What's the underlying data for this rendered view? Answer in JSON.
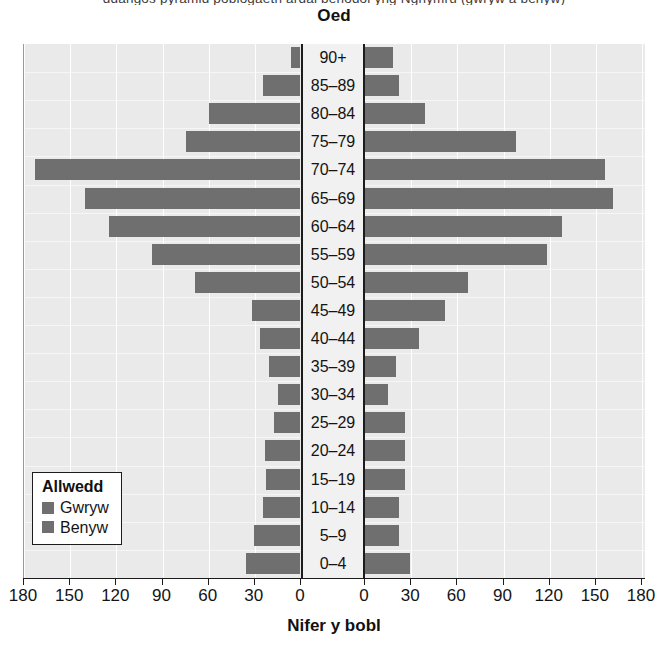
{
  "page": {
    "clipped_top_text": "ddangos pyramid poblogaeth ardal benodol yng Nghymru (gwryw a benyw)"
  },
  "chart": {
    "title": "Oed",
    "xaxis_title": "Nifer y bobl",
    "legend": {
      "title": "Allwedd",
      "items": [
        {
          "label": "Gwryw",
          "color": "#6f6f6f"
        },
        {
          "label": "Benyw",
          "color": "#6f6f6f"
        }
      ]
    },
    "tick_labels_left": [
      "180",
      "150",
      "120",
      "90",
      "60",
      "30",
      "0"
    ],
    "tick_labels_right": [
      "0",
      "30",
      "60",
      "90",
      "120",
      "150",
      "180"
    ]
  },
  "chart_data": {
    "type": "bar",
    "subtype": "population-pyramid",
    "title": "Oed",
    "xlabel": "Nifer y bobl",
    "ylabel": "Oed",
    "xlim": [
      0,
      180
    ],
    "xticks": [
      0,
      30,
      60,
      90,
      120,
      150,
      180
    ],
    "grid": true,
    "legend_position": "bottom-left",
    "categories": [
      "90+",
      "85–89",
      "80–84",
      "75–79",
      "70–74",
      "65–69",
      "60–64",
      "55–59",
      "50–54",
      "45–49",
      "40–44",
      "35–39",
      "30–34",
      "25–29",
      "20–24",
      "15–19",
      "10–14",
      "5–9",
      "0–4"
    ],
    "series": [
      {
        "name": "Gwryw",
        "side": "left",
        "color": "#6f6f6f",
        "values": [
          6,
          24,
          59,
          74,
          172,
          140,
          124,
          96,
          68,
          31,
          26,
          20,
          14,
          17,
          23,
          22,
          24,
          30,
          35
        ]
      },
      {
        "name": "Benyw",
        "side": "right",
        "color": "#6f6f6f",
        "values": [
          18,
          22,
          39,
          98,
          156,
          161,
          128,
          118,
          67,
          52,
          35,
          20,
          15,
          26,
          26,
          26,
          22,
          22,
          29
        ]
      }
    ]
  }
}
